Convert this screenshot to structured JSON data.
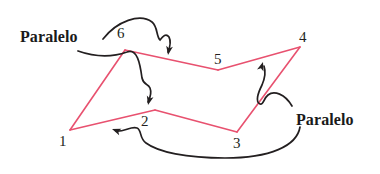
{
  "figure": {
    "background_color": "#ffffff",
    "polygon_color": "#e8516f",
    "annotation_color": "#231f20",
    "label_color": "#1a1a1a",
    "width": 380,
    "height": 174
  },
  "polygon": {
    "closed": true,
    "stroke_width": 1.6,
    "vertices": [
      {
        "id": "1",
        "label": "1",
        "x": 70,
        "y": 130,
        "label_x": 59,
        "label_y": 134
      },
      {
        "id": "2",
        "label": "2",
        "x": 155,
        "y": 110,
        "label_x": 141,
        "label_y": 114
      },
      {
        "id": "3",
        "label": "3",
        "x": 237,
        "y": 132,
        "label_x": 233,
        "label_y": 136
      },
      {
        "id": "4",
        "label": "4",
        "x": 300,
        "y": 47,
        "label_x": 299,
        "label_y": 30
      },
      {
        "id": "5",
        "label": "5",
        "x": 218,
        "y": 70,
        "label_x": 214,
        "label_y": 52
      },
      {
        "id": "6",
        "label": "6",
        "x": 125,
        "y": 50,
        "label_x": 117,
        "label_y": 26
      }
    ],
    "edges": [
      {
        "from": "1",
        "to": "2"
      },
      {
        "from": "2",
        "to": "3"
      },
      {
        "from": "3",
        "to": "4"
      },
      {
        "from": "4",
        "to": "5"
      },
      {
        "from": "5",
        "to": "6"
      },
      {
        "from": "6",
        "to": "1"
      }
    ]
  },
  "annotations": [
    {
      "id": "paralelo-top-left",
      "text": "Paralelo",
      "label_x": 20,
      "label_y": 29,
      "arrows": [
        {
          "id": "arrow-to-edge-6-5",
          "path": "M 103,39 C 117,21 140,13 152,22 C 158,27 156,36 160,40 C 163,36 166,33 169,37 C 171,41 170,47 168,52",
          "arrow_tip_x": 168,
          "arrow_tip_y": 55,
          "arrow_angle": 100
        },
        {
          "id": "arrow-to-edge-1-2",
          "path": "M 78,51 C 95,57 113,57 127,52 C 137,48 140,63 142,78 C 144,86 148,83 150,88 C 152,93 150,98 148,102",
          "arrow_tip_x": 148,
          "arrow_tip_y": 105,
          "arrow_angle": 104
        }
      ]
    },
    {
      "id": "paralelo-bottom-right",
      "text": "Paralelo",
      "label_x": 296,
      "label_y": 112,
      "arrows": [
        {
          "id": "arrow-to-edge-4-5",
          "path": "M 292,106 C 285,94 274,90 268,95 C 263,99 264,105 260,104 C 255,102 258,93 262,85 C 265,78 266,72 264,66",
          "arrow_tip_x": 263,
          "arrow_tip_y": 62,
          "arrow_angle": -72
        },
        {
          "id": "arrow-to-edge-1-2",
          "path": "M 300,127 C 297,146 270,158 225,158 C 186,158 158,152 146,143 C 139,138 142,130 137,128 C 131,126 124,132 116,131",
          "arrow_tip_x": 112,
          "arrow_tip_y": 129,
          "arrow_angle": 200
        }
      ]
    }
  ]
}
